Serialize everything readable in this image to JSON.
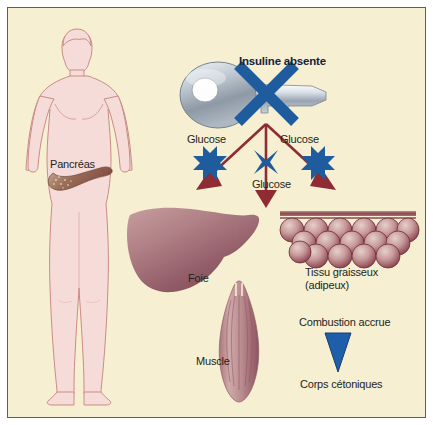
{
  "figure": {
    "language": "fr",
    "background_color": "#f7efd2",
    "border_color": "#6b5a4a",
    "width": 433,
    "height": 425
  },
  "labels": {
    "pancreas": "Pancréas",
    "insuline_absente": "Insuline absente",
    "glucose_left": "Glucose",
    "glucose_right": "Glucose",
    "glucose_middle": "Glucose",
    "foie": "Foie",
    "muscle": "Muscle",
    "tissu_graisseux_line1": "Tissu graisseux",
    "tissu_graisseux_line2": "(adipeux)",
    "combustion_accrue": "Combustion accrue",
    "corps_cetoniques": "Corps cétoniques"
  },
  "colors": {
    "background": "#f7efd2",
    "border": "#6b5a4a",
    "body_fill": "#f6dcd8",
    "body_outline": "#c98b86",
    "organ_dark": "#8e4a55",
    "organ_light": "#d8b2b2",
    "arrow_red": "#8f2b33",
    "block_blue": "#1f5c9e",
    "key_metal_light": "#e8edf2",
    "key_metal_dark": "#8f9aa6",
    "text": "#241f1c",
    "text_heading": "#14213d",
    "ketone_blue": "#1f5ea8"
  },
  "elements": {
    "human_figure": "male body silhouette, hands on hips, front view",
    "pancreas_organ": "speckled brown pancreas inside abdomen",
    "key": "silver key with round bow and toothed blade",
    "block_x": "blue X crossing the key",
    "glucose_blocks": 3,
    "fat_cell_rows": [
      6,
      5,
      6
    ],
    "liver": "liver organ, mauve gradient",
    "muscle": "fusiform striated muscle",
    "ketone_triangle": "blue downward triangle"
  },
  "icons": {
    "key": "key-icon",
    "block": "block-x-icon",
    "arrow": "arrow-icon",
    "ketone": "triangle-down-icon"
  }
}
